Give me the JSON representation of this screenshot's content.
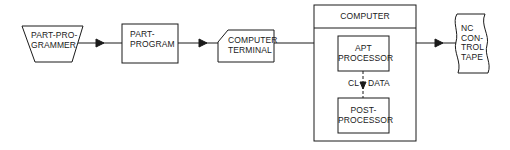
{
  "diagram": {
    "colors": {
      "stroke": "#1a1a1a",
      "background": "#ffffff"
    },
    "nodes": {
      "part_programmer": {
        "shape": "trapezoid",
        "lines": [
          "PART-PRO-",
          "GRAMMER"
        ]
      },
      "part_program": {
        "shape": "rectangle",
        "lines": [
          "PART-",
          "PROGRAM"
        ]
      },
      "computer_terminal": {
        "shape": "manual-input",
        "lines": [
          "COMPUTER",
          "TERMINAL"
        ]
      },
      "computer": {
        "shape": "container",
        "title": "COMPUTER",
        "children": {
          "apt_processor": {
            "shape": "rectangle",
            "lines": [
              "APT",
              "PROCESSOR"
            ]
          },
          "post_processor": {
            "shape": "rectangle",
            "lines": [
              "POST-",
              "PROCESSOR"
            ]
          }
        },
        "internal_edge": {
          "from": "apt_processor",
          "to": "post_processor",
          "style": "dashed",
          "label_left": "CL",
          "label_right": "DATA"
        }
      },
      "nc_control_tape": {
        "shape": "punched-tape",
        "lines": [
          "NC",
          "CON-",
          "TROL",
          "TAPE"
        ]
      }
    },
    "edges": [
      {
        "from": "part_programmer",
        "to": "part_program"
      },
      {
        "from": "part_program",
        "to": "computer_terminal"
      },
      {
        "from": "computer_terminal",
        "to": "computer"
      },
      {
        "from": "computer",
        "to": "nc_control_tape"
      }
    ]
  }
}
